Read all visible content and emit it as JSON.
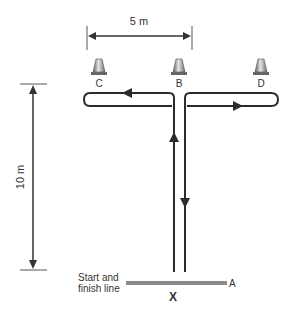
{
  "diagram": {
    "width_dimension": {
      "label": "5 m"
    },
    "height_dimension": {
      "label": "10 m"
    },
    "cones": [
      {
        "id": "C",
        "label": "C"
      },
      {
        "id": "B",
        "label": "B"
      },
      {
        "id": "D",
        "label": "D"
      }
    ],
    "start_line": {
      "label_line1": "Start and",
      "label_line2": "finish line",
      "start_marker": "X",
      "end_marker": "A"
    },
    "colors": {
      "line": "#2b2b2b",
      "start_line": "#8a8a8a",
      "cone_light": "#e0e0e0",
      "cone_dark": "#6a6a6a"
    }
  }
}
